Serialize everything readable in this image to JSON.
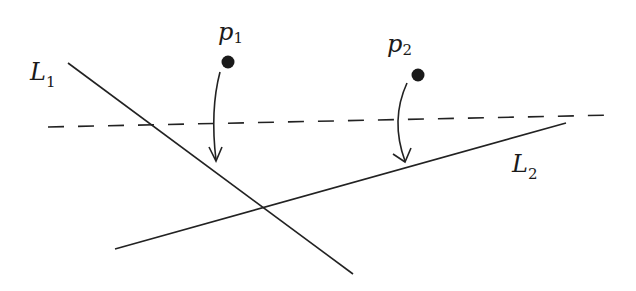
{
  "figure": {
    "width": 636,
    "height": 291,
    "background": "#ffffff",
    "stroke_color": "#222222"
  },
  "lines": {
    "L1": {
      "label": "L",
      "subscript": "1",
      "x1": 68,
      "y1": 63,
      "x2": 353,
      "y2": 274
    },
    "L2": {
      "label": "L",
      "subscript": "2",
      "x1": 115,
      "y1": 249,
      "x2": 566,
      "y2": 123
    },
    "dashed": {
      "x1": 48,
      "y1": 127,
      "x2": 614,
      "y2": 115,
      "style": "dashed"
    }
  },
  "points": {
    "p1": {
      "label": "p",
      "subscript": "1",
      "cx": 228,
      "cy": 62,
      "r": 6
    },
    "p2": {
      "label": "p",
      "subscript": "2",
      "cx": 418,
      "cy": 75,
      "r": 6
    }
  },
  "arrows": {
    "a1": {
      "from": "p1",
      "to": "L1",
      "desc": "projection of p1 onto L1"
    },
    "a2": {
      "from": "p2",
      "to": "L2",
      "desc": "projection of p2 onto L2"
    }
  }
}
